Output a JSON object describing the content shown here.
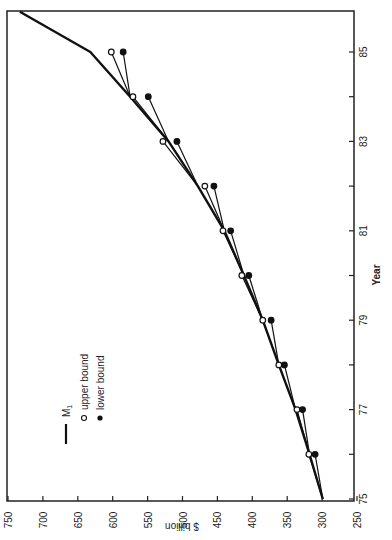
{
  "chart_data": {
    "type": "line",
    "orientation": "rotated 90 degrees (page turned sideways)",
    "title": "",
    "xlabel": "Year",
    "ylabel": "$ billion",
    "x_ticks": [
      "75",
      "77",
      "79",
      "81",
      "83",
      "85"
    ],
    "x_minor_ticks": [
      76,
      78,
      80,
      82,
      84
    ],
    "y_ticks": [
      "250",
      "300",
      "350",
      "400",
      "450",
      "500",
      "550",
      "600",
      "650",
      "700",
      "750"
    ],
    "xlim": [
      75,
      86
    ],
    "ylim": [
      250,
      750
    ],
    "grid": false,
    "legend": {
      "position": "upper-left (in rotated view)",
      "entries": [
        {
          "label": "M",
          "subscript": "1",
          "marker": "line"
        },
        {
          "label": "upper bound",
          "marker": "open-circle"
        },
        {
          "label": "lower bound",
          "marker": "filled-circle"
        }
      ]
    },
    "x": [
      75,
      76,
      77,
      78,
      79,
      80,
      81,
      82,
      83,
      84,
      85
    ],
    "series": [
      {
        "name": "M1",
        "style": "thick-line",
        "points": [
          [
            75,
            299
          ],
          [
            76,
            318
          ],
          [
            77,
            338
          ],
          [
            78,
            362
          ],
          [
            79,
            385
          ],
          [
            80,
            412
          ],
          [
            81,
            440
          ],
          [
            82,
            478
          ],
          [
            83,
            520
          ],
          [
            84,
            575
          ],
          [
            85,
            632
          ],
          [
            85.9,
            733
          ]
        ]
      },
      {
        "name": "upper bound",
        "style": "open-circle",
        "values": [
          null,
          319,
          336,
          362,
          385,
          415,
          442,
          468,
          528,
          571,
          602
        ]
      },
      {
        "name": "lower bound",
        "style": "filled-circle",
        "values": [
          null,
          310,
          328,
          354,
          373,
          405,
          431,
          455,
          508,
          549,
          585
        ]
      }
    ]
  }
}
